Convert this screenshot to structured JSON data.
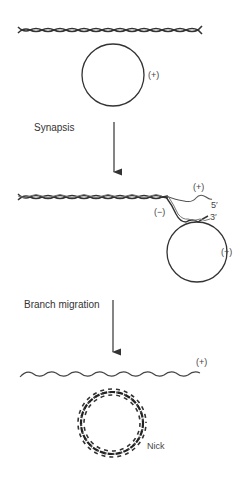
{
  "figure": {
    "stages": [
      {
        "name": "initial",
        "duplex_label": "",
        "circle_label": "(+)"
      },
      {
        "name": "after-synapsis",
        "strand_plus_label": "(+)",
        "end_5_label": "5′",
        "end_3_label": "3′",
        "strand_minus_label": "(−)",
        "circle_label": "(+)"
      },
      {
        "name": "after-branch-migration",
        "linear_label": "(+)",
        "nick_label": "Nick"
      }
    ],
    "steps": [
      {
        "label": "Synapsis"
      },
      {
        "label": "Branch migration"
      }
    ],
    "colors": {
      "line": "#333333",
      "background": "#ffffff"
    }
  }
}
